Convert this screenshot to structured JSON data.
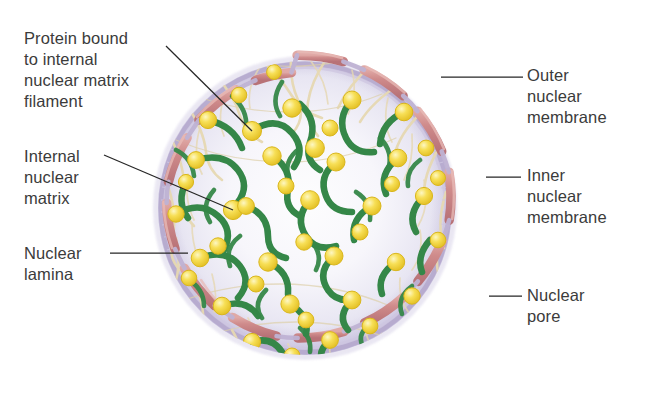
{
  "figure": {
    "type": "biological-diagram",
    "background": "#ffffff",
    "canvas": {
      "width": 646,
      "height": 417
    }
  },
  "labels": {
    "protein_bound": "Protein bound\nto internal\nnuclear matrix\nfilament",
    "internal_matrix": "Internal\nnuclear\nmatrix",
    "nuclear_lamina": "Nuclear\nlamina",
    "outer_membrane": "Outer\nnuclear\nmembrane",
    "inner_membrane": "Inner\nnuclear\nmembrane",
    "nuclear_pore": "Nuclear\npore"
  },
  "colors": {
    "text": "#3b3b3b",
    "leader_line": "#262626",
    "outer_membrane": "#cf8b8b",
    "outer_membrane_dark": "#b36f72",
    "inner_membrane": "#b9aed2",
    "lamina": "#c9c2de",
    "nucleoplasm": "#e8e6f2",
    "nucleoplasm_center": "#fbfbfd",
    "filament_green": "#3a8c4a",
    "filament_green_dark": "#2c7340",
    "protein_yellow": "#f3d844",
    "protein_yellow_light": "#fbefa0",
    "matrix_fiber": "#ece0bd",
    "background": "#ffffff"
  },
  "structures": {
    "nucleus_center": {
      "cx": 305,
      "cy": 208
    },
    "nucleus_radius": 150,
    "pore_count": 12,
    "protein_sphere_count": 44,
    "filament_count": 46
  },
  "leader_lines": [
    {
      "name": "protein-bound-leader",
      "x1": 166,
      "y1": 46,
      "x2": 252,
      "y2": 131
    },
    {
      "name": "internal-matrix-leader",
      "x1": 104,
      "y1": 155,
      "x2": 233,
      "y2": 210
    },
    {
      "name": "nuclear-lamina-leader",
      "x1": 110,
      "y1": 253,
      "x2": 188,
      "y2": 253
    },
    {
      "name": "outer-membrane-leader",
      "x1": 441,
      "y1": 77,
      "x2": 523,
      "y2": 77
    },
    {
      "name": "inner-membrane-leader",
      "x1": 486,
      "y1": 177,
      "x2": 521,
      "y2": 177
    },
    {
      "name": "nuclear-pore-leader",
      "x1": 489,
      "y1": 296,
      "x2": 522,
      "y2": 296
    }
  ]
}
